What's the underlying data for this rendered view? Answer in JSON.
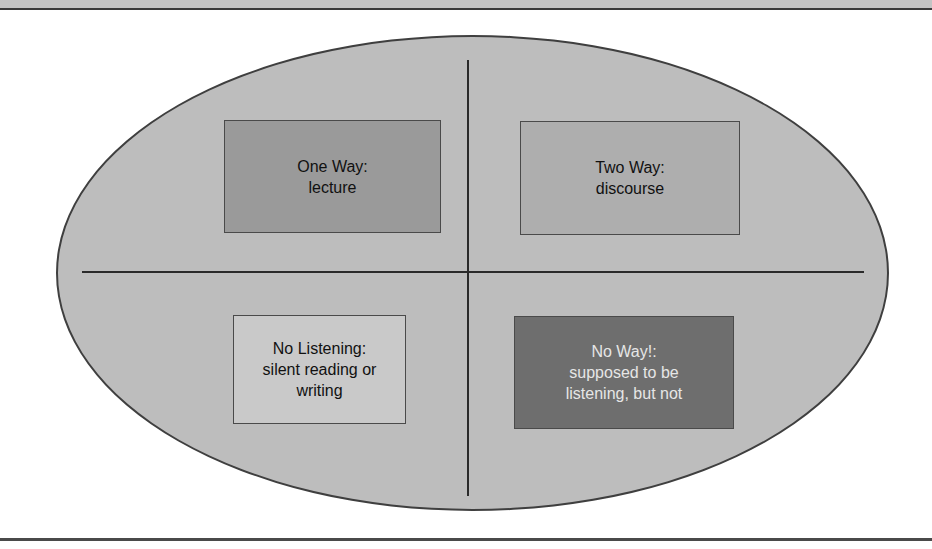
{
  "diagram": {
    "type": "quadrant-ellipse",
    "colors": {
      "ellipse_fill": "#bdbdbd",
      "one_way_fill": "#9a9a9a",
      "two_way_fill": "#aeaeae",
      "no_listening_fill": "#c9c9c9",
      "no_way_fill": "#6e6e6e"
    },
    "quadrants": [
      {
        "position": "top-left",
        "title": "One Way:",
        "description": "lecture"
      },
      {
        "position": "top-right",
        "title": "Two Way:",
        "description": "discourse"
      },
      {
        "position": "bottom-left",
        "title": "No Listening:",
        "description_lines": [
          "silent reading or",
          "writing"
        ]
      },
      {
        "position": "bottom-right",
        "title": "No Way!:",
        "description_lines": [
          "supposed to be",
          "listening, but not"
        ]
      }
    ]
  }
}
